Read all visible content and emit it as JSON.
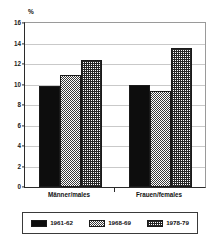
{
  "chart_data": {
    "type": "bar",
    "title": "",
    "subtitle": "",
    "xlabel": "",
    "ylabel": "%",
    "ylim": [
      0,
      16
    ],
    "yticks": [
      0,
      2,
      4,
      6,
      8,
      10,
      12,
      14,
      16
    ],
    "ytick_labels": [
      "0",
      "2",
      "4",
      "6",
      "8",
      "10",
      "12",
      "14",
      "16"
    ],
    "grid": true,
    "legend_position": "bottom",
    "categories": [
      "Männer/males",
      "Frauen/females"
    ],
    "series": [
      {
        "name": "1961-62",
        "values": [
          9.9,
          10.0
        ],
        "fill": "solid-black"
      },
      {
        "name": "1968-69",
        "values": [
          10.9,
          9.4
        ],
        "fill": "fine-checker"
      },
      {
        "name": "1978-79",
        "values": [
          12.4,
          13.6
        ],
        "fill": "cross-hatch"
      }
    ],
    "annotations": []
  },
  "axis": {
    "unit_label": "%"
  },
  "legend": {
    "entries": [
      {
        "label": "1961-62"
      },
      {
        "label": "1968-69"
      },
      {
        "label": "1978-79"
      }
    ]
  },
  "colors": {
    "series1": "#0d0d0d",
    "series2": "#3a3a3a",
    "series3": "#262626",
    "axis": "#2b2b2b",
    "grid": "#c9c9c9",
    "background": "#ffffff"
  }
}
